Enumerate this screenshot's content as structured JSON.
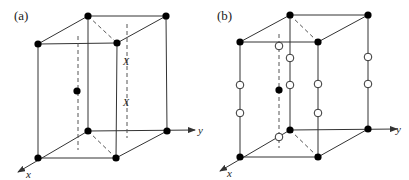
{
  "panels": [
    {
      "id": "a",
      "label": "(a)",
      "axis_x": "x",
      "axis_y": "y",
      "markers": [
        "X",
        "X"
      ]
    },
    {
      "id": "b",
      "label": "(b)",
      "axis_x": "x",
      "axis_y": "y"
    }
  ],
  "colors": {
    "line": "#333333",
    "dashed": "#555555",
    "filled_atom": "#000000",
    "open_atom_fill": "#ffffff"
  }
}
